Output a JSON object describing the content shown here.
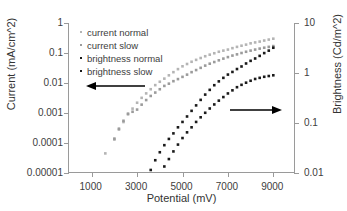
{
  "chart_data": {
    "type": "scatter",
    "title": "",
    "xlabel": "Potential (mV)",
    "ylabel": "Current (mA/cm^2)",
    "ylabel_right": "Brightness (Cd/m^2)",
    "xlim": [
      0,
      10000
    ],
    "xscale": "linear",
    "yscale": "log",
    "ylim": [
      1e-05,
      1
    ],
    "ylim_right": [
      0.01,
      10
    ],
    "grid": false,
    "legend_position": "upper-left",
    "x_ticks": [
      "1000",
      "3000",
      "5000",
      "7000",
      "9000"
    ],
    "x_tick_values": [
      1000,
      3000,
      5000,
      7000,
      9000
    ],
    "y_ticks_left": [
      "1",
      "0.1",
      "0.01",
      "0.001",
      "0.0001",
      "0.00001"
    ],
    "y_tick_values_left": [
      1,
      0.1,
      0.01,
      0.001,
      0.0001,
      1e-05
    ],
    "y_ticks_right": [
      "10",
      "1",
      "0.1",
      "0.01"
    ],
    "y_tick_values_right": [
      10,
      1,
      0.1,
      0.01
    ],
    "colors": {
      "current_normal": "#b4b4b4",
      "current_slow": "#9b9b9b",
      "brightness_normal": "#1a1a1a",
      "brightness_slow": "#1a1a1a",
      "axis": "#9a9a9a",
      "text": "#3d3d3d"
    },
    "series": [
      {
        "name": "current normal",
        "axis": "left",
        "color": "#b4b4b4",
        "marker": "square",
        "x": [
          1600,
          2000,
          2200,
          2400,
          2600,
          2800,
          3000,
          3200,
          3400,
          3600,
          3800,
          4000,
          4200,
          4400,
          4600,
          4800,
          5000,
          5200,
          5400,
          5600,
          5800,
          6000,
          6200,
          6400,
          6600,
          6800,
          7000,
          7200,
          7400,
          7600,
          7800,
          8000,
          8200,
          8400,
          8600,
          8800,
          9000
        ],
        "y": [
          4.5e-05,
          0.00013,
          0.00028,
          0.0005,
          0.0009,
          0.0014,
          0.0022,
          0.0032,
          0.0045,
          0.0062,
          0.0085,
          0.011,
          0.014,
          0.018,
          0.023,
          0.029,
          0.036,
          0.043,
          0.051,
          0.059,
          0.068,
          0.078,
          0.088,
          0.098,
          0.11,
          0.12,
          0.13,
          0.145,
          0.16,
          0.175,
          0.19,
          0.21,
          0.225,
          0.24,
          0.26,
          0.28,
          0.3
        ]
      },
      {
        "name": "current slow",
        "axis": "left",
        "color": "#9b9b9b",
        "marker": "square",
        "x": [
          2000,
          2200,
          2400,
          2600,
          2800,
          3000,
          3200,
          3400,
          3600,
          3800,
          4000,
          4200,
          4400,
          4600,
          4800,
          5000,
          5200,
          5400,
          5600,
          5800,
          6000,
          6200,
          6400,
          6600,
          6800,
          7000,
          7200,
          7400,
          7600,
          7800,
          8000,
          8200,
          8400,
          8600,
          8800,
          9000
        ],
        "y": [
          0.00014,
          0.0003,
          0.00055,
          0.00095,
          0.0011,
          0.0013,
          0.0019,
          0.0027,
          0.0037,
          0.0048,
          0.0062,
          0.008,
          0.0095,
          0.0115,
          0.0135,
          0.016,
          0.019,
          0.023,
          0.027,
          0.032,
          0.038,
          0.044,
          0.05,
          0.057,
          0.065,
          0.073,
          0.082,
          0.09,
          0.1,
          0.11,
          0.12,
          0.13,
          0.14,
          0.15,
          0.16,
          0.17
        ]
      },
      {
        "name": "brightness normal",
        "axis": "right",
        "color": "#1a1a1a",
        "marker": "square",
        "x": [
          3600,
          3800,
          4000,
          4200,
          4400,
          4600,
          4800,
          5000,
          5200,
          5400,
          5600,
          5800,
          6000,
          6200,
          6400,
          6600,
          6800,
          7000,
          7200,
          7400,
          7600,
          7800,
          8000,
          8200,
          8400,
          8600,
          8800,
          9000
        ],
        "y": [
          0.0115,
          0.018,
          0.026,
          0.036,
          0.048,
          0.062,
          0.082,
          0.105,
          0.135,
          0.175,
          0.225,
          0.29,
          0.37,
          0.46,
          0.57,
          0.68,
          0.8,
          0.93,
          1.05,
          1.2,
          1.35,
          1.55,
          1.75,
          1.95,
          2.2,
          2.5,
          2.8,
          3.2
        ]
      },
      {
        "name": "brightness slow",
        "axis": "right",
        "color": "#1a1a1a",
        "marker": "square",
        "x": [
          4200,
          4400,
          4600,
          4800,
          5000,
          5200,
          5400,
          5600,
          5800,
          6000,
          6200,
          6400,
          6600,
          6800,
          7000,
          7200,
          7400,
          7600,
          7800,
          8000,
          8200,
          8400,
          8600,
          8800,
          9000
        ],
        "y": [
          0.0135,
          0.019,
          0.027,
          0.037,
          0.05,
          0.065,
          0.082,
          0.105,
          0.13,
          0.16,
          0.195,
          0.235,
          0.28,
          0.33,
          0.39,
          0.45,
          0.52,
          0.58,
          0.64,
          0.7,
          0.76,
          0.8,
          0.84,
          0.87,
          0.9
        ]
      }
    ],
    "annotations": [
      {
        "name": "left-axis-arrow",
        "points_to": "left",
        "x_start_px": 145,
        "x_end_px": 86,
        "y_px": 86,
        "color": "#000000"
      },
      {
        "name": "right-axis-arrow",
        "points_to": "right",
        "x_start_px": 232,
        "x_end_px": 281,
        "y_px": 110,
        "color": "#000000"
      }
    ]
  },
  "legend": {
    "items": [
      {
        "label": "current normal",
        "color": "#b4b4b4"
      },
      {
        "label": "current slow",
        "color": "#9b9b9b"
      },
      {
        "label": "brightness normal",
        "color": "#1a1a1a"
      },
      {
        "label": "brightness slow",
        "color": "#1a1a1a"
      }
    ]
  },
  "axes": {
    "left_title": "Current (mA/cm^2)",
    "right_title": "Brightness (Cd/m^2)",
    "bottom_title": "Potential (mV)"
  }
}
